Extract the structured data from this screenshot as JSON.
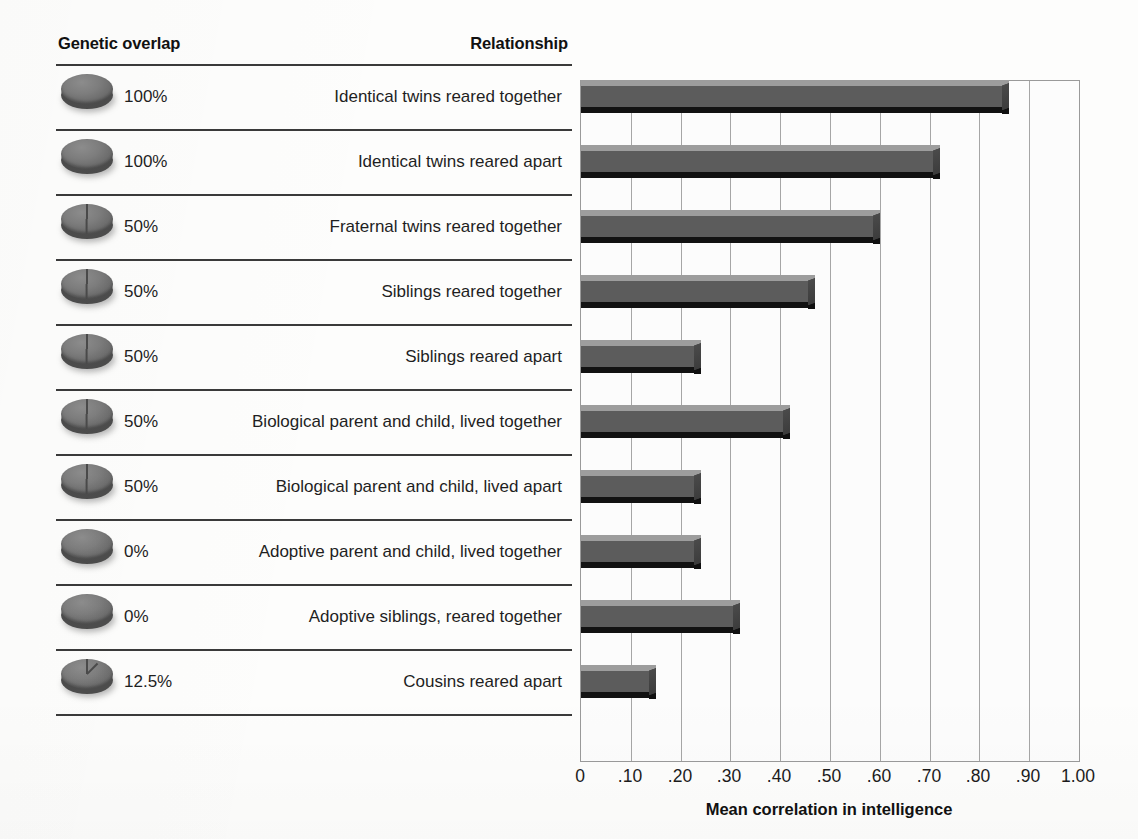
{
  "headers": {
    "genetic_overlap": "Genetic overlap",
    "relationship": "Relationship"
  },
  "axis": {
    "x_title": "Mean correlation in intelligence",
    "x_ticks": [
      "0",
      ".10",
      ".20",
      ".30",
      ".40",
      ".50",
      ".60",
      ".70",
      ".80",
      ".90",
      "1.00"
    ]
  },
  "colors": {
    "bar_face": "#5c5c5c",
    "bar_top": "#9d9d9d",
    "bar_bottom": "#121212",
    "gridline": "#a6a6a6",
    "separator": "#3a3a3a",
    "text": "#1f1f1f"
  },
  "rows": [
    {
      "overlap": "100%",
      "overlap_value": 100,
      "relationship": "Identical twins reared together",
      "correlation": 0.86
    },
    {
      "overlap": "100%",
      "overlap_value": 100,
      "relationship": "Identical twins reared apart",
      "correlation": 0.72
    },
    {
      "overlap": "50%",
      "overlap_value": 50,
      "relationship": "Fraternal twins reared together",
      "correlation": 0.6
    },
    {
      "overlap": "50%",
      "overlap_value": 50,
      "relationship": "Siblings reared together",
      "correlation": 0.47
    },
    {
      "overlap": "50%",
      "overlap_value": 50,
      "relationship": "Siblings reared apart",
      "correlation": 0.24
    },
    {
      "overlap": "50%",
      "overlap_value": 50,
      "relationship": "Biological parent and child, lived together",
      "correlation": 0.42
    },
    {
      "overlap": "50%",
      "overlap_value": 50,
      "relationship": "Biological parent and child, lived apart",
      "correlation": 0.24
    },
    {
      "overlap": "0%",
      "overlap_value": 0,
      "relationship": "Adoptive parent and child, lived together",
      "correlation": 0.24
    },
    {
      "overlap": "0%",
      "overlap_value": 0,
      "relationship": "Adoptive siblings, reared together",
      "correlation": 0.32
    },
    {
      "overlap": "12.5%",
      "overlap_value": 12.5,
      "relationship": "Cousins reared apart",
      "correlation": 0.15
    }
  ],
  "chart_data": {
    "type": "bar",
    "orientation": "horizontal",
    "title": "",
    "xlabel": "Mean correlation in intelligence",
    "ylabel": "",
    "xlim": [
      0,
      1.0
    ],
    "xticks": [
      0,
      0.1,
      0.2,
      0.3,
      0.4,
      0.5,
      0.6,
      0.7,
      0.8,
      0.9,
      1.0
    ],
    "xticklabels": [
      "0",
      ".10",
      ".20",
      ".30",
      ".40",
      ".50",
      ".60",
      ".70",
      ".80",
      ".90",
      "1.00"
    ],
    "grid": "vertical",
    "legend": "none",
    "categories": [
      "Identical twins reared together",
      "Identical twins reared apart",
      "Fraternal twins reared together",
      "Siblings reared together",
      "Siblings reared apart",
      "Biological parent and child, lived together",
      "Biological parent and child, lived apart",
      "Adoptive parent and child, lived together",
      "Adoptive siblings, reared together",
      "Cousins reared apart"
    ],
    "values": [
      0.86,
      0.72,
      0.6,
      0.47,
      0.24,
      0.42,
      0.24,
      0.24,
      0.32,
      0.15
    ],
    "secondary_column": {
      "name": "Genetic overlap",
      "labels": [
        "100%",
        "100%",
        "50%",
        "50%",
        "50%",
        "50%",
        "50%",
        "0%",
        "0%",
        "12.5%"
      ],
      "values": [
        100,
        100,
        50,
        50,
        50,
        50,
        50,
        0,
        0,
        12.5
      ]
    }
  }
}
